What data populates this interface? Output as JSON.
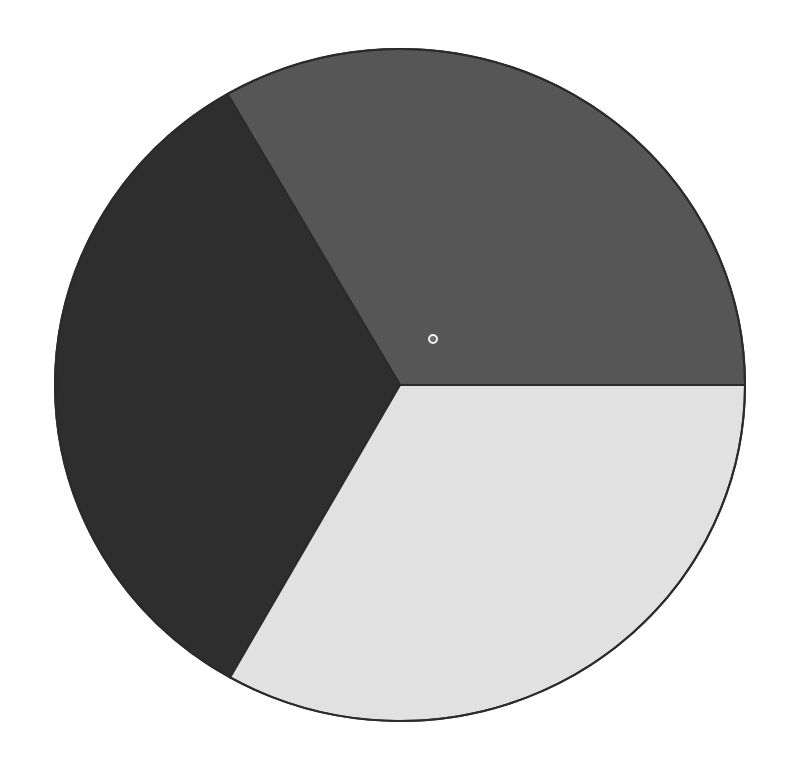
{
  "page": {
    "background_color": "#ffffff",
    "width": 788,
    "height": 759,
    "title": ""
  },
  "chart_data": {
    "type": "pie",
    "title": "",
    "subtitle": "",
    "xlabel": "",
    "ylabel": "",
    "legend": "none",
    "grid": false,
    "labels_shown": false,
    "categories": [
      "Slice 1",
      "Slice 2",
      "Slice 3"
    ],
    "values": [
      33.3,
      33.5,
      33.2
    ],
    "slices": [
      {
        "name": "Slice 1",
        "label": "",
        "value": 33.3,
        "percent": 33.3,
        "color": "#565656",
        "start_angle_deg": 0,
        "end_angle_deg": 120
      },
      {
        "name": "Slice 2",
        "label": "",
        "value": 33.5,
        "percent": 33.5,
        "color": "#2e2e2e",
        "start_angle_deg": 120,
        "end_angle_deg": 240.5
      },
      {
        "name": "Slice 3",
        "label": "",
        "value": 33.2,
        "percent": 33.2,
        "color": "#e1e1e1",
        "start_angle_deg": 240.5,
        "end_angle_deg": 360
      }
    ],
    "geometry": {
      "center_x": 400,
      "center_y": 385,
      "radius_x": 345,
      "radius_y": 336,
      "outline_color": "#2b2b2b",
      "outline_width": 2
    },
    "markers": [
      {
        "name": "data-point-marker",
        "shape": "circle-outline",
        "x": 433,
        "y": 339,
        "radius": 4,
        "fill": "#6b6b6b",
        "stroke": "#f2f2f2",
        "stroke_width": 2,
        "label": ""
      }
    ],
    "colors": {
      "slice_medium_gray": "#565656",
      "slice_dark_gray": "#2e2e2e",
      "slice_light_gray": "#e1e1e1",
      "outline": "#2b2b2b",
      "background": "#ffffff",
      "marker_stroke": "#f2f2f2"
    }
  }
}
